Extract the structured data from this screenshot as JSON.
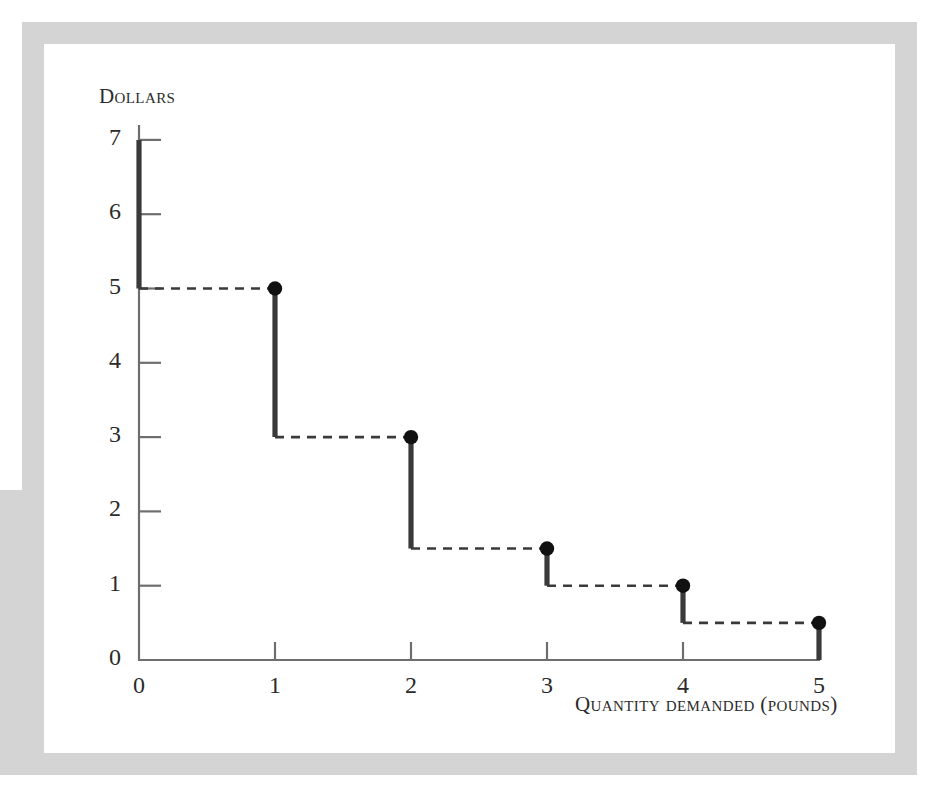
{
  "figure": {
    "frame_color": "#d4d4d4",
    "background_color": "#ffffff",
    "ink_color": "#3a3a3a"
  },
  "axes": {
    "y_caption": "Dollars",
    "x_caption": "Quantity demanded (pounds)",
    "y_ticks": [
      "7",
      "6",
      "5",
      "4",
      "3",
      "2",
      "1",
      "0"
    ],
    "x_ticks": [
      "0",
      "1",
      "2",
      "3",
      "4",
      "5"
    ]
  },
  "chart_data": {
    "type": "line",
    "subtype": "step-demand-curve",
    "title": "",
    "xlabel": "Quantity demanded (pounds)",
    "ylabel": "Dollars",
    "xlim": [
      0,
      5
    ],
    "ylim": [
      0,
      7
    ],
    "grid": false,
    "legend": null,
    "x_tick_values": [
      0,
      1,
      2,
      3,
      4,
      5
    ],
    "y_tick_values": [
      0,
      1,
      2,
      3,
      4,
      5,
      6,
      7
    ],
    "x": [
      1,
      2,
      3,
      4,
      5
    ],
    "values": [
      5,
      3,
      1.5,
      1,
      0.5
    ],
    "points": [
      {
        "x": 1,
        "y": 5
      },
      {
        "x": 2,
        "y": 3
      },
      {
        "x": 3,
        "y": 1.5
      },
      {
        "x": 4,
        "y": 1
      },
      {
        "x": 5,
        "y": 0.5
      }
    ],
    "risers": [
      {
        "x": 0,
        "y_top": 7,
        "y_bottom": 5
      },
      {
        "x": 1,
        "y_top": 5,
        "y_bottom": 3
      },
      {
        "x": 2,
        "y_top": 3,
        "y_bottom": 1.5
      },
      {
        "x": 3,
        "y_top": 1.5,
        "y_bottom": 1
      },
      {
        "x": 4,
        "y_top": 1,
        "y_bottom": 0.5
      },
      {
        "x": 5,
        "y_top": 0.5,
        "y_bottom": 0
      }
    ],
    "treads": [
      {
        "y": 5,
        "x_start": 0,
        "x_end": 1
      },
      {
        "y": 3,
        "x_start": 1,
        "x_end": 2
      },
      {
        "y": 1.5,
        "x_start": 2,
        "x_end": 3
      },
      {
        "y": 1,
        "x_start": 3,
        "x_end": 4
      },
      {
        "y": 0.5,
        "x_start": 4,
        "x_end": 5
      }
    ],
    "tread_style": "dashed",
    "riser_style": "solid",
    "marker": "filled-circle"
  }
}
